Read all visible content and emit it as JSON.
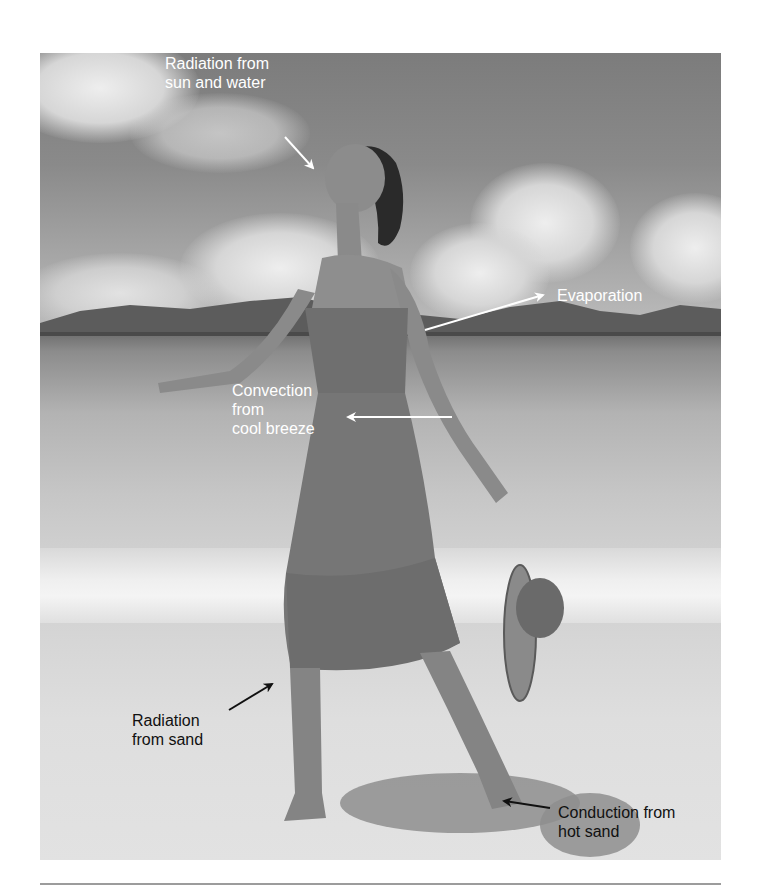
{
  "figure": {
    "labels": [
      {
        "id": "radiation-sun-water",
        "text": "Radiation from\nsun and water",
        "color": "#ffffff"
      },
      {
        "id": "evaporation",
        "text": "Evaporation",
        "color": "#ffffff"
      },
      {
        "id": "convection",
        "text": "Convection\nfrom\ncool breeze",
        "color": "#ffffff"
      },
      {
        "id": "radiation-sand",
        "text": "Radiation\nfrom sand",
        "color": "#111111"
      },
      {
        "id": "conduction",
        "text": "Conduction from\nhot sand",
        "color": "#111111"
      }
    ],
    "colors": {
      "light_label": "#ffffff",
      "dark_label": "#111111",
      "rule": "#9c9c9c"
    }
  }
}
